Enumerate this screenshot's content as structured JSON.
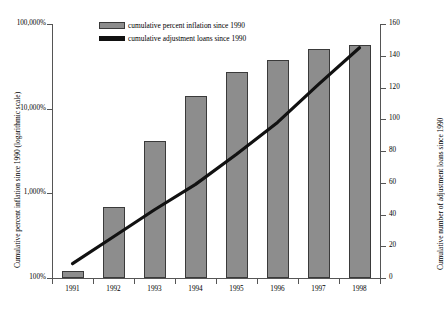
{
  "chart_data": {
    "type": "bar",
    "title": "",
    "xlabel": "",
    "categories": [
      "1991",
      "1992",
      "1993",
      "1994",
      "1995",
      "1996",
      "1997",
      "1998"
    ],
    "grid": false,
    "legend_position": "top-center",
    "axes": {
      "left": {
        "label": "Cumulative percent inflation since 1990 (logarithmic scale)",
        "scale": "log",
        "ticks": [
          "100%",
          "1,000%",
          "10,000%",
          "100,000%"
        ],
        "tick_values": [
          100,
          1000,
          10000,
          100000
        ],
        "ylim": [
          100,
          100000
        ]
      },
      "right": {
        "label": "Cumulative number of adjustment loans since 1990",
        "scale": "linear",
        "ticks": [
          "0",
          "20",
          "40",
          "60",
          "80",
          "100",
          "120",
          "140",
          "160"
        ],
        "tick_values": [
          0,
          20,
          40,
          60,
          80,
          100,
          120,
          140,
          160
        ],
        "ylim": [
          0,
          160
        ]
      }
    },
    "series": [
      {
        "name": "cumulative percent inflation since 1990",
        "type": "bar",
        "axis": "left",
        "color": "#8d8d8d",
        "values": [
          120,
          690,
          4100,
          14000,
          27000,
          38000,
          50000,
          56000
        ]
      },
      {
        "name": "cumulative adjustment loans since 1990",
        "type": "line",
        "axis": "right",
        "color": "#111111",
        "values": [
          9,
          26,
          43,
          59,
          78,
          98,
          122,
          145
        ]
      }
    ]
  },
  "legend": {
    "items": [
      {
        "label": "cumulative percent inflation since 1990",
        "marker": "bar-swatch"
      },
      {
        "label": "cumulative adjustment loans since 1990",
        "marker": "line-swatch"
      }
    ]
  }
}
